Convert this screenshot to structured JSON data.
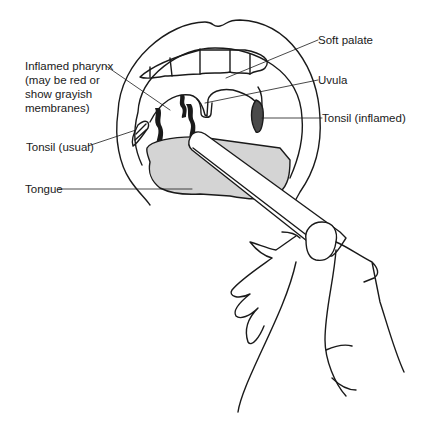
{
  "figure": {
    "labels": {
      "soft_palate": "Soft palate",
      "uvula": "Uvula",
      "tonsil_inflamed": "Tonsil (inflamed)",
      "inflamed_pharynx_line1": "Inflamed pharynx",
      "inflamed_pharynx_line2": "(may be red or",
      "inflamed_pharynx_line3": "show grayish",
      "inflamed_pharynx_line4": "membranes)",
      "tonsil_usual": "Tonsil (usual)",
      "tongue": "Tongue"
    },
    "colors": {
      "line": "#1a1a1a",
      "tongue_fill": "#d4d4d4",
      "tonsil_inflamed_fill": "#4a4a4a",
      "background": "#ffffff"
    }
  }
}
